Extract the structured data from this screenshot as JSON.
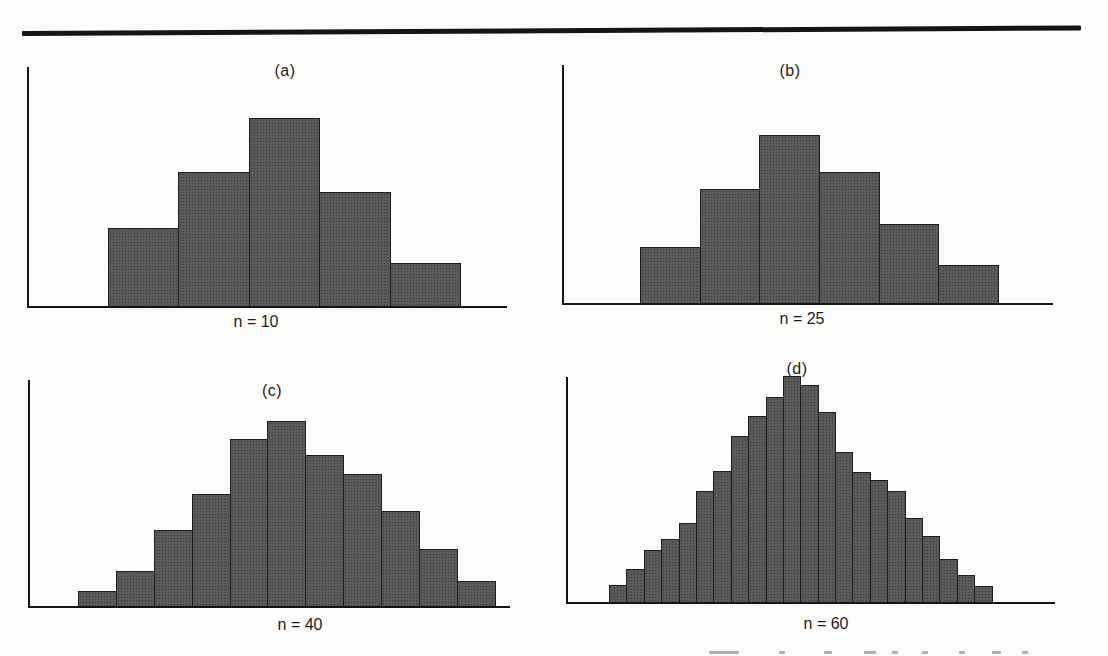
{
  "page": {
    "background": "#fcfcfb",
    "description_visible_text_only": true
  },
  "colors": {
    "bar_fill": "#5a5a5a",
    "bar_dot": "#3a3a3a",
    "bar_edge": "#1d1d1d",
    "axis": "#151515",
    "text": "#1c1c1c",
    "top_rule": "#151515"
  },
  "chart_data": [
    {
      "type": "bar",
      "title": "(a)",
      "xlabel": "n = 10",
      "ylabel": "",
      "n": 10,
      "bar_count": 5,
      "values": [
        78,
        134,
        188,
        114,
        43
      ],
      "value_units": "relative frequency, arbitrary units (no tick labels shown)",
      "categories": [],
      "layout": {
        "grid": false,
        "axis_ticks": "none",
        "legend": "none",
        "bars_touching": true
      }
    },
    {
      "type": "bar",
      "title": "(b)",
      "xlabel": "n = 25",
      "ylabel": "",
      "n": 25,
      "bar_count": 6,
      "values": [
        56,
        114,
        168,
        131,
        79,
        38
      ],
      "value_units": "relative frequency, arbitrary units (no tick labels shown)",
      "categories": [],
      "layout": {
        "grid": false,
        "axis_ticks": "none",
        "legend": "none",
        "bars_touching": true
      }
    },
    {
      "type": "bar",
      "title": "(c)",
      "xlabel": "n = 40",
      "ylabel": "",
      "n": 40,
      "bar_count": 11,
      "values": [
        15,
        35,
        76,
        112,
        167,
        185,
        151,
        132,
        95,
        57,
        25
      ],
      "value_units": "relative frequency, arbitrary units (no tick labels shown)",
      "categories": [],
      "layout": {
        "grid": false,
        "axis_ticks": "none",
        "legend": "none",
        "bars_touching": true
      }
    },
    {
      "type": "bar",
      "title": "(d)",
      "xlabel": "n = 60",
      "ylabel": "",
      "n": 60,
      "bar_count": 22,
      "values": [
        17,
        33,
        52,
        63,
        79,
        111,
        131,
        166,
        186,
        205,
        226,
        217,
        190,
        150,
        130,
        122,
        111,
        84,
        66,
        43,
        27,
        16
      ],
      "value_units": "relative frequency, arbitrary units (no tick labels shown)",
      "categories": [],
      "layout": {
        "grid": false,
        "axis_ticks": "none",
        "legend": "none",
        "bars_touching": true
      }
    }
  ]
}
